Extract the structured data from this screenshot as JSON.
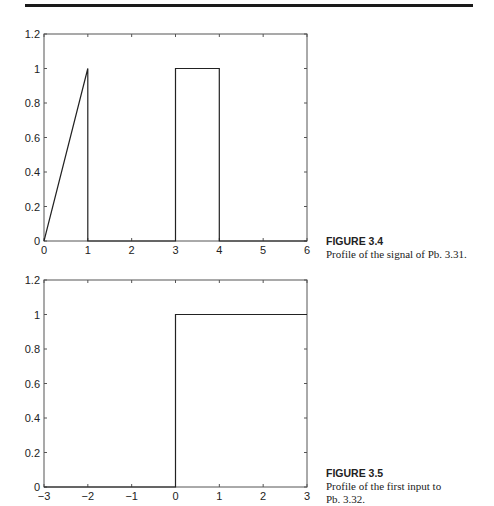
{
  "chart_data": [
    {
      "type": "line",
      "title": "",
      "xlabel": "",
      "ylabel": "",
      "xlim": [
        0,
        6
      ],
      "ylim": [
        0,
        1.2
      ],
      "xticks": [
        0,
        1,
        2,
        3,
        4,
        5,
        6
      ],
      "yticks": [
        0,
        0.2,
        0.4,
        0.6,
        0.8,
        1,
        1.2
      ],
      "xtick_labels": [
        "0",
        "1",
        "2",
        "3",
        "4",
        "5",
        "6"
      ],
      "ytick_labels": [
        "0",
        "0.2",
        "0.4",
        "0.6",
        "0.8",
        "1",
        "1.2"
      ],
      "grid": false,
      "series": [
        {
          "name": "signal",
          "x": [
            0,
            1,
            1,
            3,
            3,
            4,
            4,
            6
          ],
          "y": [
            0,
            1,
            0,
            0,
            1,
            1,
            0,
            0
          ]
        }
      ],
      "caption": {
        "label": "FIGURE 3.4",
        "text": "Profile of the signal of Pb. 3.31."
      }
    },
    {
      "type": "line",
      "title": "",
      "xlabel": "",
      "ylabel": "",
      "xlim": [
        -3,
        3
      ],
      "ylim": [
        0,
        1.2
      ],
      "xticks": [
        -3,
        -2,
        -1,
        0,
        1,
        2,
        3
      ],
      "yticks": [
        0,
        0.2,
        0.4,
        0.6,
        0.8,
        1,
        1.2
      ],
      "xtick_labels": [
        "−3",
        "−2",
        "−1",
        "0",
        "1",
        "2",
        "3"
      ],
      "ytick_labels": [
        "0",
        "0.2",
        "0.4",
        "0.6",
        "0.8",
        "1",
        "1.2"
      ],
      "grid": false,
      "series": [
        {
          "name": "input",
          "x": [
            -3,
            0,
            0,
            3
          ],
          "y": [
            0,
            0,
            1,
            1
          ]
        }
      ],
      "caption": {
        "label": "FIGURE 3.5",
        "text_lines": [
          "Profile of the first input to",
          "Pb. 3.32."
        ]
      }
    }
  ]
}
